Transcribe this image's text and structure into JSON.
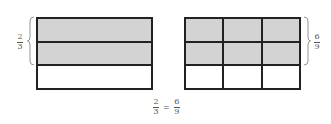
{
  "colors": {
    "shaded": "#d3d3d3",
    "unshaded": "#ffffff",
    "line": "#222222"
  },
  "left_model": {
    "rows": 3,
    "cols": 1,
    "shaded_rows": 2,
    "label": {
      "numerator": "2",
      "denominator": "3"
    }
  },
  "right_model": {
    "rows": 3,
    "cols": 3,
    "shaded_rows": 2,
    "label": {
      "numerator": "6",
      "denominator": "9"
    }
  },
  "equation": {
    "left": {
      "numerator": "2",
      "denominator": "3"
    },
    "operator": "=",
    "right": {
      "numerator": "6",
      "denominator": "9"
    }
  }
}
